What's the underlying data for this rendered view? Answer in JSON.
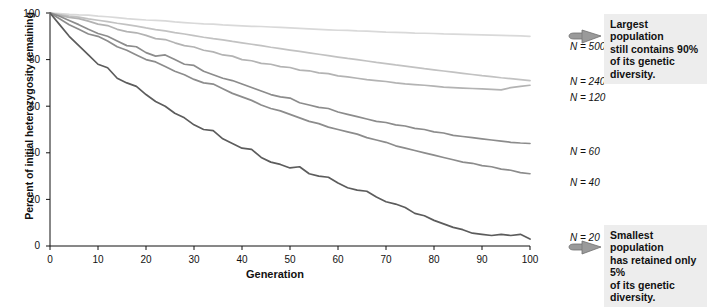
{
  "chart_data": {
    "type": "line",
    "title": "",
    "xlabel": "Generation",
    "ylabel": "Percent of initial heterozygosity remaining",
    "xlim": [
      0,
      100
    ],
    "ylim": [
      0,
      100
    ],
    "grid": false,
    "legend_position": "right-inline",
    "xticks": [
      "0",
      "10",
      "20",
      "30",
      "40",
      "50",
      "60",
      "70",
      "80",
      "90",
      "100"
    ],
    "yticks": [
      "0",
      "20",
      "40",
      "60",
      "80",
      "100"
    ],
    "x": [
      0,
      2,
      4,
      6,
      8,
      10,
      12,
      14,
      16,
      18,
      20,
      22,
      24,
      26,
      28,
      30,
      32,
      34,
      36,
      38,
      40,
      42,
      44,
      46,
      48,
      50,
      52,
      54,
      56,
      58,
      60,
      62,
      64,
      66,
      68,
      70,
      72,
      74,
      76,
      78,
      80,
      82,
      84,
      86,
      88,
      90,
      92,
      94,
      96,
      98,
      100
    ],
    "series": [
      {
        "name": "N = 500",
        "label": "N = 500",
        "color": "#d9d9d9",
        "label_x": 570,
        "label_y": 41,
        "values": [
          100,
          99.7,
          99.4,
          99.2,
          99.1,
          98.7,
          98.4,
          98.0,
          97.6,
          97.3,
          97.0,
          96.8,
          96.6,
          96.2,
          95.9,
          95.6,
          95.3,
          95.2,
          94.9,
          94.7,
          94.5,
          94.3,
          94.2,
          94.0,
          93.8,
          93.6,
          93.4,
          93.2,
          93.0,
          92.8,
          92.6,
          92.5,
          92.3,
          92.2,
          92.0,
          91.8,
          91.7,
          91.6,
          91.4,
          91.3,
          91.2,
          91.0,
          90.9,
          90.8,
          90.7,
          90.6,
          90.5,
          90.4,
          90.3,
          90.2,
          90.0
        ]
      },
      {
        "name": "N = 240",
        "label": "N = 240",
        "color": "#c2c2c2",
        "label_x": 570,
        "label_y": 76,
        "values": [
          100,
          99.3,
          98.7,
          98.2,
          97.5,
          96.9,
          96.3,
          95.6,
          95.0,
          94.4,
          93.6,
          92.9,
          92.3,
          91.6,
          91.0,
          90.3,
          89.6,
          89.0,
          88.5,
          87.8,
          87.2,
          86.6,
          86.0,
          85.3,
          84.7,
          84.1,
          83.5,
          82.9,
          82.3,
          81.7,
          81.1,
          80.5,
          80.0,
          79.4,
          78.8,
          78.3,
          77.7,
          77.2,
          76.7,
          76.1,
          75.6,
          75.1,
          74.6,
          74.1,
          73.6,
          73.1,
          72.7,
          72.2,
          71.8,
          71.4,
          71.0
        ]
      },
      {
        "name": "N = 120",
        "label": "N = 120",
        "color": "#b3b3b3",
        "label_x": 570,
        "label_y": 92,
        "values": [
          100,
          99.0,
          98.1,
          97.6,
          96.5,
          95.2,
          94.6,
          93.0,
          92.0,
          91.5,
          90.4,
          89.0,
          88.6,
          87.2,
          86.0,
          85.4,
          84.0,
          83.3,
          82.0,
          81.5,
          80.0,
          79.5,
          78.4,
          78.0,
          77.0,
          76.6,
          75.5,
          75.2,
          74.3,
          74.0,
          73.0,
          72.6,
          72.0,
          71.4,
          71.0,
          70.6,
          70.0,
          69.6,
          69.3,
          69.0,
          68.6,
          68.2,
          68.0,
          67.8,
          67.6,
          67.4,
          67.2,
          67.0,
          68.0,
          68.5,
          69.0
        ]
      },
      {
        "name": "N = 60",
        "label": "N = 60",
        "color": "#8c8c8c",
        "label_x": 570,
        "label_y": 146,
        "values": [
          100,
          98.6,
          96.8,
          95.0,
          93.0,
          91.2,
          90.0,
          88.0,
          86.0,
          85.5,
          83.0,
          81.5,
          82.0,
          80.0,
          78.0,
          77.5,
          75.0,
          73.5,
          72.0,
          71.0,
          69.5,
          68.0,
          66.5,
          65.0,
          64.0,
          63.5,
          61.5,
          60.5,
          59.5,
          59.0,
          57.5,
          56.5,
          55.5,
          54.5,
          53.5,
          53.0,
          52.0,
          51.5,
          50.5,
          50.0,
          49.0,
          48.5,
          47.5,
          47.0,
          46.5,
          46.0,
          45.5,
          45.0,
          44.5,
          44.2,
          44.0
        ]
      },
      {
        "name": "N = 40",
        "label": "N = 40",
        "color": "#8c8c8c",
        "label_x": 570,
        "label_y": 177,
        "values": [
          100,
          97.5,
          95.0,
          93.0,
          91.0,
          90.0,
          88.0,
          85.5,
          84.0,
          82.0,
          80.0,
          79.0,
          77.0,
          75.0,
          73.5,
          71.5,
          70.0,
          69.5,
          67.5,
          65.5,
          64.0,
          62.5,
          60.5,
          59.0,
          58.0,
          56.5,
          55.0,
          53.5,
          52.5,
          51.0,
          50.0,
          49.0,
          48.0,
          46.5,
          45.5,
          44.5,
          43.0,
          42.0,
          41.0,
          40.0,
          39.0,
          38.0,
          37.0,
          36.0,
          35.5,
          34.5,
          34.0,
          33.0,
          32.5,
          31.5,
          31.0
        ]
      },
      {
        "name": "N = 20",
        "label": "N = 20",
        "color": "#5c5c5c",
        "label_x": 570,
        "label_y": 232,
        "values": [
          100,
          95.0,
          90.0,
          86.0,
          82.0,
          78.0,
          76.5,
          72.0,
          70.0,
          68.5,
          65.0,
          62.0,
          60.0,
          57.0,
          55.0,
          52.0,
          50.0,
          49.5,
          46.0,
          44.0,
          42.0,
          41.5,
          38.0,
          36.0,
          35.0,
          33.5,
          34.0,
          31.0,
          30.0,
          29.5,
          27.0,
          25.0,
          24.0,
          23.5,
          21.0,
          19.0,
          18.0,
          16.5,
          14.0,
          13.0,
          11.0,
          9.5,
          8.0,
          7.0,
          5.5,
          5.0,
          4.5,
          5.0,
          4.5,
          5.0,
          3.0
        ]
      }
    ],
    "annotations": [
      {
        "name": "largest-population-callout",
        "lines": [
          "Largest population",
          "still contains 90%",
          "of its genetic diversity."
        ],
        "x": 604,
        "y": 14
      },
      {
        "name": "smallest-population-callout",
        "lines": [
          "Smallest population",
          "has retained only 5%",
          "of its genetic diversity."
        ],
        "x": 604,
        "y": 225
      }
    ]
  }
}
